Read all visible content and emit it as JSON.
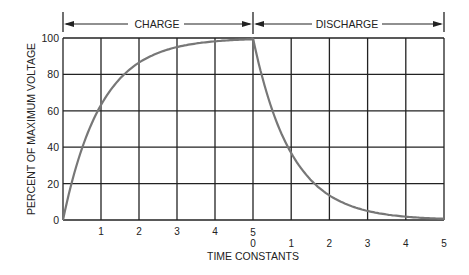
{
  "chart_data": {
    "type": "line",
    "title": "",
    "xlabel": "TIME CONSTANTS",
    "ylabel": "PERCENT OF MAXIMUM VOLTAGE",
    "ylim": [
      0,
      100
    ],
    "yticks": [
      0,
      20,
      40,
      60,
      80,
      100
    ],
    "grid": true,
    "legend": null,
    "sections": [
      {
        "label": "CHARGE",
        "xticks": [
          "1",
          "2",
          "3",
          "4",
          "5"
        ]
      },
      {
        "label": "DISCHARGE",
        "xticks": [
          "0",
          "1",
          "2",
          "3",
          "4",
          "5"
        ]
      }
    ],
    "series": [
      {
        "name": "Charge",
        "x": [
          0,
          0.5,
          1,
          2,
          3,
          4,
          5
        ],
        "values": [
          0,
          39,
          63,
          86,
          95,
          98,
          99
        ]
      },
      {
        "name": "Discharge",
        "x": [
          0,
          0.5,
          1,
          2,
          3,
          4,
          5
        ],
        "values": [
          100,
          61,
          37,
          14,
          5,
          2,
          1
        ]
      }
    ],
    "curve_color": "#777777",
    "grid_color": "#222222"
  },
  "labels": {
    "charge": "CHARGE",
    "discharge": "DISCHARGE",
    "xlabel": "TIME CONSTANTS",
    "ylabel": "PERCENT OF MAXIMUM VOLTAGE",
    "mid_top": "5",
    "mid_bottom": "0"
  }
}
